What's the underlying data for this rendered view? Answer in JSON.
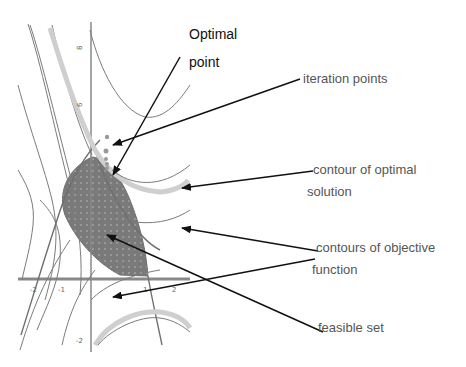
{
  "diagram": {
    "annotations": {
      "optimal_point": {
        "line1": "Optimal",
        "line2": "point"
      },
      "iteration_points": "iteration points",
      "contour_optimal": {
        "line1": "contour of optimal",
        "line2": "solution"
      },
      "contours_objective": {
        "line1": "contours of objective",
        "line2": "function"
      },
      "feasible_set": "feasible set"
    },
    "axis": {
      "y_ticks": [
        "8",
        "6",
        "-2"
      ],
      "x_ticks": [
        "-2",
        "-1",
        "1",
        "2"
      ]
    },
    "colors": {
      "feasible_fill": "#7a7a7a",
      "contour_line": "#777777",
      "optimal_contour": "#c8c8c8",
      "axis": "#888888",
      "arrow": "#111111",
      "iteration_point": "#999999"
    }
  }
}
